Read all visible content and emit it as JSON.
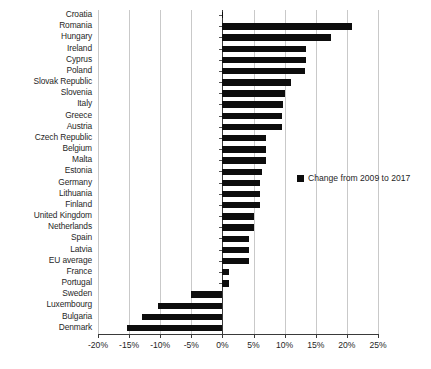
{
  "chart_data": {
    "type": "bar",
    "orientation": "horizontal",
    "title": "",
    "xlabel": "",
    "ylabel": "",
    "xlim": [
      -20,
      25
    ],
    "xtick_values": [
      -20,
      -15,
      -10,
      -5,
      0,
      5,
      10,
      15,
      20,
      25
    ],
    "xtick_labels": [
      "-20%",
      "-15%",
      "-10%",
      "-5%",
      "0%",
      "5%",
      "10%",
      "15%",
      "20%",
      "25%"
    ],
    "grid": true,
    "legend": {
      "position": "right",
      "entries": [
        {
          "label": "Change from 2009 to 2017",
          "color": "#0d0d0d"
        }
      ]
    },
    "series_name": "Change from 2009 to 2017",
    "bar_color": "#0d0d0d",
    "categories": [
      "Croatia",
      "Romania",
      "Hungary",
      "Ireland",
      "Cyprus",
      "Poland",
      "Slovak Republic",
      "Slovenia",
      "Italy",
      "Greece",
      "Austria",
      "Czech Republic",
      "Belgium",
      "Malta",
      "Estonia",
      "Germany",
      "Lithuania",
      "Finland",
      "United Kingdom",
      "Netherlands",
      "Spain",
      "Latvia",
      "EU average",
      "France",
      "Portugal",
      "Sweden",
      "Luxembourg",
      "Bulgaria",
      "Denmark"
    ],
    "values": [
      0.0,
      20.8,
      17.5,
      13.5,
      13.5,
      13.2,
      11.0,
      10.0,
      9.8,
      9.5,
      9.5,
      7.0,
      7.0,
      7.0,
      6.3,
      6.0,
      6.0,
      6.0,
      5.0,
      5.0,
      4.3,
      4.3,
      4.3,
      1.0,
      1.0,
      -5.0,
      -10.3,
      -13.0,
      -15.3
    ]
  }
}
